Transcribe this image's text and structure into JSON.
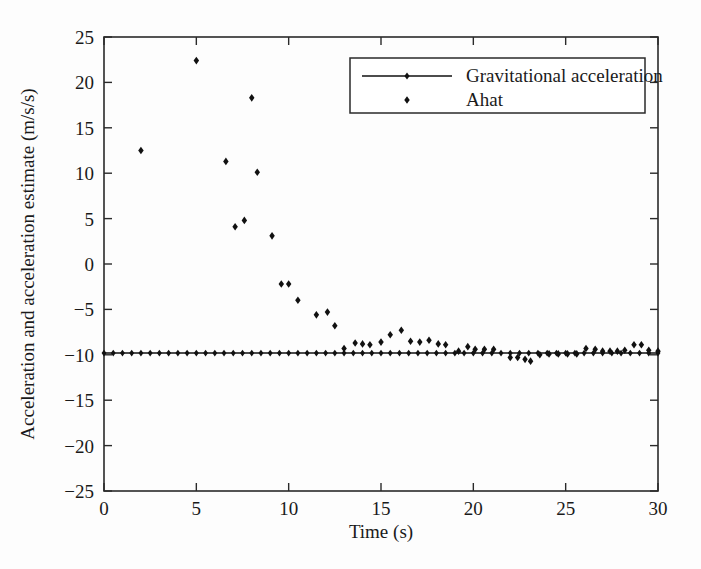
{
  "chart_data": {
    "type": "scatter",
    "title": "",
    "xlabel": "Time (s)",
    "ylabel": "Acceleration and acceleration estimate (m/s/s)",
    "xlim": [
      0,
      30
    ],
    "ylim": [
      -25,
      25
    ],
    "xticks": [
      0,
      5,
      10,
      15,
      20,
      25,
      30
    ],
    "yticks": [
      25,
      20,
      15,
      10,
      5,
      0,
      -5,
      -10,
      -15,
      -20,
      -25
    ],
    "xticklabels": [
      "0",
      "5",
      "10",
      "15",
      "20",
      "25",
      "30"
    ],
    "yticklabels": [
      "25",
      "20",
      "15",
      "10",
      "5",
      "0",
      "-5",
      "-10",
      "-15",
      "-20",
      "-25"
    ],
    "grid": false,
    "legend_position": "upper-right",
    "series": [
      {
        "name": "Gravitational acceleration",
        "marker": "diamond",
        "line": true,
        "color": "#111111",
        "constant_value": -9.81,
        "x": [
          0.0,
          0.5,
          1.0,
          1.5,
          2.0,
          2.5,
          3.0,
          3.5,
          4.0,
          4.5,
          5.0,
          5.5,
          6.0,
          6.5,
          7.0,
          7.5,
          8.0,
          8.5,
          9.0,
          9.5,
          10.0,
          10.5,
          11.0,
          11.5,
          12.0,
          12.5,
          13.0,
          13.5,
          14.0,
          14.5,
          15.0,
          15.5,
          16.0,
          16.5,
          17.0,
          17.5,
          18.0,
          18.5,
          19.0,
          19.5,
          20.0,
          20.5,
          21.0,
          21.5,
          22.0,
          22.5,
          23.0,
          23.5,
          24.0,
          24.5,
          25.0,
          25.5,
          26.0,
          26.5,
          27.0,
          27.5,
          28.0,
          28.5,
          29.0,
          29.5,
          30.0
        ],
        "y": [
          -9.81,
          -9.81,
          -9.81,
          -9.81,
          -9.81,
          -9.81,
          -9.81,
          -9.81,
          -9.81,
          -9.81,
          -9.81,
          -9.81,
          -9.81,
          -9.81,
          -9.81,
          -9.81,
          -9.81,
          -9.81,
          -9.81,
          -9.81,
          -9.81,
          -9.81,
          -9.81,
          -9.81,
          -9.81,
          -9.81,
          -9.81,
          -9.81,
          -9.81,
          -9.81,
          -9.81,
          -9.81,
          -9.81,
          -9.81,
          -9.81,
          -9.81,
          -9.81,
          -9.81,
          -9.81,
          -9.81,
          -9.81,
          -9.81,
          -9.81,
          -9.81,
          -9.81,
          -9.81,
          -9.81,
          -9.81,
          -9.81,
          -9.81,
          -9.81,
          -9.81,
          -9.81,
          -9.81,
          -9.81,
          -9.81,
          -9.81,
          -9.81,
          -9.81,
          -9.81,
          -9.81
        ]
      },
      {
        "name": "Ahat",
        "marker": "diamond",
        "line": false,
        "color": "#111111",
        "x": [
          2.0,
          5.0,
          6.6,
          7.1,
          7.6,
          8.0,
          8.3,
          9.1,
          9.6,
          10.0,
          10.5,
          11.5,
          12.1,
          12.5,
          13.0,
          13.6,
          14.0,
          14.4,
          15.0,
          15.5,
          16.1,
          16.6,
          17.1,
          17.6,
          18.1,
          18.5,
          19.2,
          19.7,
          20.1,
          20.6,
          21.1,
          22.0,
          22.4,
          22.8,
          23.1,
          23.6,
          24.1,
          24.6,
          25.1,
          25.6,
          26.1,
          26.6,
          27.0,
          27.4,
          27.8,
          28.2,
          28.7,
          29.1,
          29.5,
          30.0
        ],
        "y": [
          12.5,
          22.4,
          11.3,
          4.1,
          4.8,
          18.3,
          10.1,
          3.1,
          -2.2,
          -2.2,
          -4.0,
          -5.6,
          -5.3,
          -6.8,
          -9.3,
          -8.7,
          -8.8,
          -8.9,
          -8.6,
          -7.8,
          -7.3,
          -8.5,
          -8.6,
          -8.4,
          -8.8,
          -8.9,
          -9.6,
          -9.1,
          -9.4,
          -9.4,
          -9.4,
          -10.3,
          -10.3,
          -10.5,
          -10.7,
          -10.0,
          -9.9,
          -9.9,
          -9.9,
          -9.9,
          -9.3,
          -9.4,
          -9.6,
          -9.6,
          -9.6,
          -9.5,
          -8.9,
          -8.9,
          -9.5,
          -9.6
        ]
      }
    ],
    "legend_entries": [
      {
        "label": "Gravitational acceleration",
        "marker": "diamond",
        "line": true
      },
      {
        "label": "Ahat",
        "marker": "diamond",
        "line": false
      }
    ]
  },
  "axes": {
    "x_title": "Time (s)",
    "y_title": "Acceleration and acceleration estimate (m/s/s)"
  },
  "legend": {
    "entry_0_label": "Gravitational acceleration",
    "entry_1_label": "Ahat"
  },
  "ticks": {
    "x": [
      "0",
      "5",
      "10",
      "15",
      "20",
      "25",
      "30"
    ],
    "y": [
      "25",
      "20",
      "15",
      "10",
      "5",
      "0",
      "-5",
      "-10",
      "-15",
      "-20",
      "-25"
    ]
  },
  "colors": {
    "ink": "#111111",
    "frame": "#2a2a2a",
    "background": "#fdfdfd"
  }
}
